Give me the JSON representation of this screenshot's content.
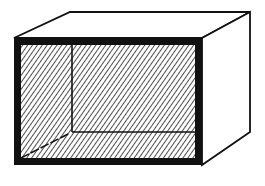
{
  "diagram": {
    "title": "",
    "colors": {
      "stroke": "#111111",
      "background": "#ffffff",
      "hatch": "#222222"
    },
    "labels": []
  }
}
